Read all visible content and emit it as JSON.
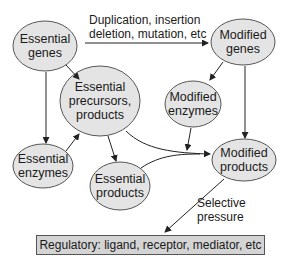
{
  "diagram": {
    "nodes": {
      "essential_genes": {
        "line1": "Essential",
        "line2": "genes"
      },
      "modified_genes": {
        "line1": "Modified",
        "line2": "genes"
      },
      "essential_precursors": {
        "line1": "Essential",
        "line2": "precursors,",
        "line3": "products"
      },
      "modified_enzymes": {
        "line1": "Modified",
        "line2": "enzymes"
      },
      "essential_enzymes": {
        "line1": "Essential",
        "line2": "enzymes"
      },
      "essential_products": {
        "line1": "Essential",
        "line2": "products"
      },
      "modified_products": {
        "line1": "Modified",
        "line2": "products"
      }
    },
    "edge_labels": {
      "mutation_line1": "Duplication, insertion",
      "mutation_line2": "deletion, mutation, etc",
      "selective_line1": "Selective",
      "selective_line2": "pressure"
    },
    "regulatory_box": "Regulatory: ligand, receptor, mediator, etc",
    "colors": {
      "node_fill": "#e4e4e4",
      "node_stroke": "#555555",
      "box_fill": "#d4d4d4",
      "arrow": "#222222"
    }
  }
}
